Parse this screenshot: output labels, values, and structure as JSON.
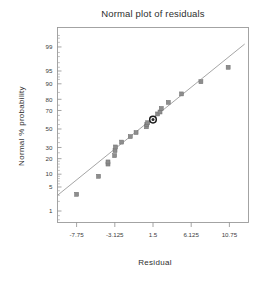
{
  "chart_data": {
    "type": "scatter",
    "title": "Normal plot of residuals",
    "xlabel": "Residual",
    "ylabel": "Normal % probability",
    "grid": false,
    "legend": null,
    "xlim": [
      -10.0625,
      13.0625
    ],
    "xticks": [
      -7.75,
      -3.125,
      1.5,
      6.125,
      10.75
    ],
    "xtick_labels": [
      "-7.75",
      "-3.125",
      "1.5",
      "6.125",
      "10.75"
    ],
    "yscale": "normal-probability",
    "ylim": [
      0.4,
      99.8
    ],
    "yticks": [
      1,
      5,
      10,
      20,
      30,
      50,
      70,
      80,
      90,
      95,
      99
    ],
    "ytick_labels": [
      "1",
      "5",
      "10",
      "20",
      "30",
      "50",
      "70",
      "80",
      "90",
      "95",
      "99"
    ],
    "series": [
      {
        "name": "residual points",
        "marker": "square",
        "x": [
          -7.75,
          -5.1,
          -3.95,
          -3.95,
          -3.15,
          -3.1,
          -3.05,
          -2.3,
          -1.25,
          -0.55,
          0.7,
          0.75,
          0.85,
          1.5,
          2.05,
          2.35,
          2.5,
          3.35,
          4.95,
          7.3,
          10.6
        ],
        "y": [
          3.2,
          9.0,
          16.0,
          17.5,
          22.5,
          27.0,
          30.5,
          35.5,
          41.5,
          46.0,
          52.5,
          55.0,
          57.0,
          60.5,
          66.5,
          68.5,
          72.0,
          77.5,
          84.0,
          91.0,
          96.0
        ]
      },
      {
        "name": "highlighted point",
        "marker": "circle-filled",
        "x": [
          1.5
        ],
        "y": [
          60.5
        ]
      }
    ],
    "reference_line": {
      "name": "normal fit line",
      "x": [
        -10.0625,
        12.6
      ],
      "y": [
        3.0,
        99.2
      ]
    }
  }
}
